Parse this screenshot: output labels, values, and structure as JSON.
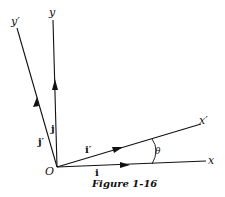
{
  "figure": {
    "caption": "Figure 1-16",
    "origin_label": "O",
    "axes": {
      "x": "x",
      "y": "y",
      "x_prime": "x′",
      "y_prime": "y′"
    },
    "vectors": {
      "i": "i",
      "j": "j",
      "i_prime": "i′",
      "j_prime": "j′"
    },
    "angle_label": "θ",
    "colors": {
      "ink": "#111111",
      "background": "#ffffff"
    }
  }
}
